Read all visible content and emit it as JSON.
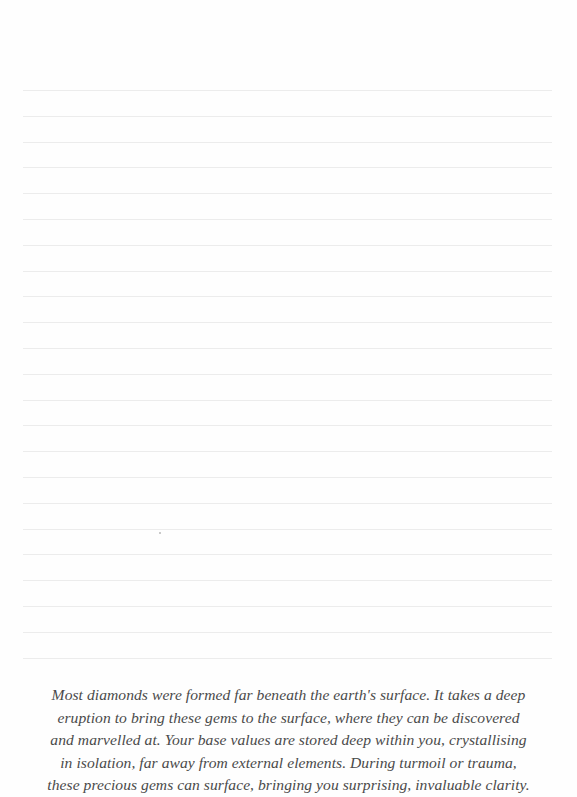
{
  "page": {
    "background": "#fefefe",
    "rule_color": "#ececec",
    "rule_count": 23,
    "rule_start_y": 90,
    "rule_spacing": 25.8
  },
  "quote": {
    "color": "#4a4a4a",
    "lines": [
      "Most diamonds were formed far beneath the earth's surface. It takes a deep",
      "eruption to bring these gems to the surface, where they can be discovered",
      "and marvelled at. Your base values are stored deep within you, crystallising",
      "in isolation, far away from external elements. During turmoil or trauma,",
      "these precious gems can surface, bringing you surprising, invaluable clarity."
    ]
  }
}
